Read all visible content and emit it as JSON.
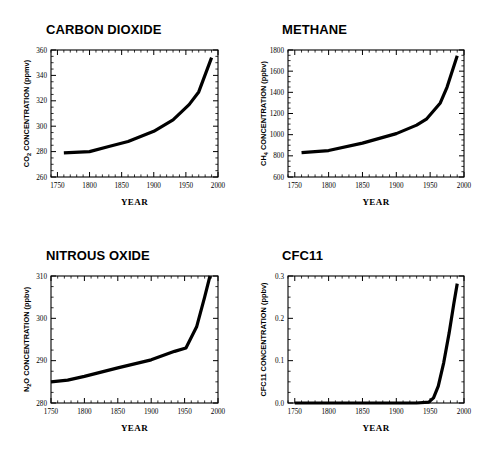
{
  "figure": {
    "panel_count": 4,
    "background": "#ffffff",
    "line_color": "#000000"
  },
  "chart_data": [
    {
      "type": "line",
      "title": "CARBON DIOXIDE",
      "xlabel": "YEAR",
      "ylabel": "CO2 CONCENTRATION (ppmv)",
      "ylabel_prefix": "CO",
      "ylabel_sub": "2",
      "ylabel_suffix": " CONCENTRATION (ppmv)",
      "units": "ppmv",
      "species": "CO2",
      "xlim": [
        1740,
        2000
      ],
      "ylim": [
        260,
        360
      ],
      "xticks": [
        1750,
        1800,
        1850,
        1900,
        1950,
        2000
      ],
      "xtick_labels": [
        "1750",
        "1800",
        "1850",
        "1900",
        "1950",
        "2000"
      ],
      "yticks": [
        260,
        280,
        300,
        320,
        340,
        360
      ],
      "ytick_labels": [
        "260",
        "280",
        "300",
        "320",
        "340",
        "360"
      ],
      "minor_x_step": 10,
      "minor_y_step": 5,
      "grid": false,
      "legend": null,
      "x": [
        1760,
        1800,
        1830,
        1860,
        1900,
        1930,
        1955,
        1970,
        1990
      ],
      "y": [
        279,
        280,
        284,
        288,
        296,
        305,
        317,
        327,
        354
      ]
    },
    {
      "type": "line",
      "title": "METHANE",
      "xlabel": "YEAR",
      "ylabel": "CH4 CONCENTRATION (ppbv)",
      "ylabel_prefix": "CH",
      "ylabel_sub": "4",
      "ylabel_suffix": " CONCENTRATION (ppbv)",
      "units": "ppbv",
      "species": "CH4",
      "xlim": [
        1740,
        2000
      ],
      "ylim": [
        600,
        1800
      ],
      "xticks": [
        1750,
        1800,
        1850,
        1900,
        1950,
        2000
      ],
      "xtick_labels": [
        "1750",
        "1800",
        "1850",
        "1900",
        "1950",
        "2000"
      ],
      "yticks": [
        600,
        800,
        1000,
        1200,
        1400,
        1600,
        1800
      ],
      "ytick_labels": [
        "600",
        "800",
        "1000",
        "1200",
        "1400",
        "1600",
        "1800"
      ],
      "minor_x_step": 10,
      "minor_y_step": 50,
      "grid": false,
      "legend": null,
      "x": [
        1760,
        1800,
        1850,
        1900,
        1930,
        1945,
        1965,
        1975,
        1990
      ],
      "y": [
        830,
        850,
        920,
        1010,
        1090,
        1150,
        1300,
        1450,
        1745
      ]
    },
    {
      "type": "line",
      "title": "NITROUS OXIDE",
      "xlabel": "YEAR",
      "ylabel": "N2O CONCENTRATION (ppbv)",
      "ylabel_prefix": "N",
      "ylabel_sub": "2",
      "ylabel_suffix": "O CONCENTRATION (ppbv)",
      "units": "ppbv",
      "species": "N2O",
      "xlim": [
        1750,
        2000
      ],
      "ylim": [
        280,
        310
      ],
      "xticks": [
        1750,
        1800,
        1850,
        1900,
        1950,
        2000
      ],
      "xtick_labels": [
        "1750",
        "1800",
        "1850",
        "1900",
        "1950",
        "2000"
      ],
      "yticks": [
        280,
        290,
        300,
        310
      ],
      "ytick_labels": [
        "280",
        "290",
        "300",
        "310"
      ],
      "minor_x_step": 10,
      "minor_y_step": 2.5,
      "grid": false,
      "legend": null,
      "x": [
        1750,
        1775,
        1800,
        1850,
        1900,
        1935,
        1952,
        1968,
        1980,
        1988
      ],
      "y": [
        285,
        285.4,
        286.3,
        288.3,
        290.2,
        292.2,
        293,
        298,
        305,
        310
      ]
    },
    {
      "type": "line",
      "title": "CFC11",
      "xlabel": "YEAR",
      "ylabel": "CFC11 CONCENTRATION (ppbv)",
      "ylabel_prefix": "CFC11 CONCENTRATION (ppbv)",
      "ylabel_sub": "",
      "ylabel_suffix": "",
      "units": "ppbv",
      "species": "CFC11",
      "xlim": [
        1740,
        2000
      ],
      "ylim": [
        0.0,
        0.3
      ],
      "xticks": [
        1750,
        1800,
        1850,
        1900,
        1950,
        2000
      ],
      "xtick_labels": [
        "1750",
        "1800",
        "1850",
        "1900",
        "1950",
        "2000"
      ],
      "yticks": [
        0.0,
        0.1,
        0.2,
        0.3
      ],
      "ytick_labels": [
        "0.0",
        "0.1",
        "0.2",
        "0.3"
      ],
      "minor_x_step": 10,
      "minor_y_step": 0.025,
      "grid": false,
      "legend": null,
      "x": [
        1750,
        1930,
        1948,
        1955,
        1962,
        1970,
        1978,
        1985,
        1990
      ],
      "y": [
        0.0,
        0.0,
        0.002,
        0.012,
        0.04,
        0.095,
        0.165,
        0.235,
        0.282
      ]
    }
  ]
}
